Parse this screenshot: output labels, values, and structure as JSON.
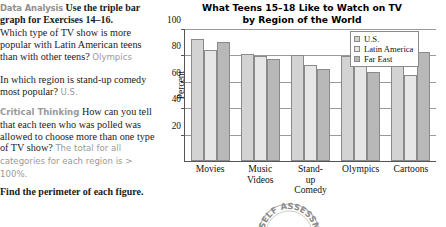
{
  "worksheet": {
    "lead_label": "Data Analysis",
    "lead_bold": "Use the triple bar",
    "lead_bold2": "graph for Exercises 14–16.",
    "questions": [
      {
        "number": "14.",
        "text": "Which type of TV show is more popular with Latin American teens than with other teens?",
        "answer": "Olympics"
      },
      {
        "number": "15.",
        "text": "In which region is stand-up comedy most popular?",
        "answer": "U.S."
      },
      {
        "number": "16.",
        "label": "Critical Thinking",
        "text": "How can you tell that each teen who was polled was allowed to choose more than one type of TV show?",
        "answer": "The total for all categories for each region is > 100%."
      }
    ],
    "footer": "Find the perimeter of each figure.",
    "badge_text": "SELF ASSESSMENT"
  },
  "chart_data": {
    "type": "bar",
    "title": "What Teens 15–18 Like to Watch on TV by Region of the World",
    "title_line1": "What Teens 15–18 Like to Watch on TV",
    "title_line2": "by Region of the World",
    "xlabel": "",
    "ylabel": "Percent",
    "ylim": [
      0,
      100
    ],
    "yticks": [
      20,
      40,
      60,
      80,
      100
    ],
    "grid": true,
    "legend_position": "upper-right-inside",
    "categories": [
      "Movies",
      "Music\nVideos",
      "Stand-up\nComedy",
      "Olympics",
      "Cartoons"
    ],
    "category_labels": [
      "Movies",
      "Music Videos",
      "Stand-up Comedy",
      "Olympics",
      "Cartoons"
    ],
    "series": [
      {
        "name": "U.S.",
        "color": "#d3d3d3",
        "values": [
          93,
          82,
          81,
          80,
          78
        ]
      },
      {
        "name": "Latin America",
        "color": "#e6e6e6",
        "values": [
          85,
          80,
          73,
          81,
          66
        ]
      },
      {
        "name": "Far East",
        "color": "#b8b8b8",
        "values": [
          91,
          78,
          70,
          68,
          83
        ]
      }
    ]
  }
}
